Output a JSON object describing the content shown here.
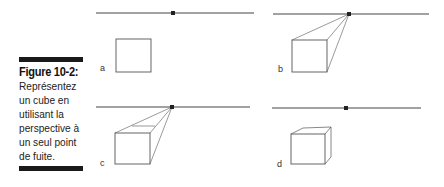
{
  "caption": {
    "title": "Figure 10-2:",
    "lines": [
      "Représentez",
      "un cube en",
      "utilisant la",
      "perspective à",
      "un seul point",
      "de fuite."
    ]
  },
  "panels": [
    {
      "label": "a"
    },
    {
      "label": "b"
    },
    {
      "label": "c"
    },
    {
      "label": "d"
    }
  ]
}
